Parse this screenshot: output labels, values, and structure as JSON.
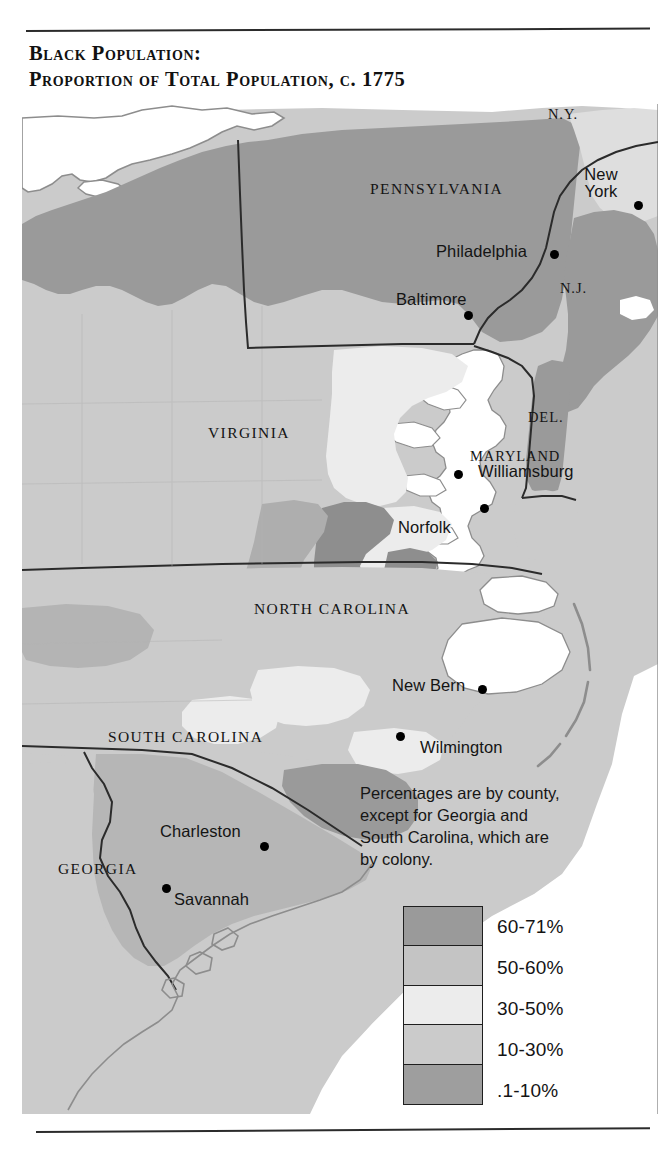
{
  "title": {
    "line1": "Black Population:",
    "line2": "Proportion of Total Population, c. 1775"
  },
  "map": {
    "note_lines": [
      "Percentages are by county,",
      "except for Georgia and",
      "South Carolina, which are",
      "by colony."
    ],
    "states": [
      {
        "name": "pennsylvania",
        "label": "PENNSYLVANIA"
      },
      {
        "name": "new-york",
        "label": "N.Y."
      },
      {
        "name": "new-jersey",
        "label": "N.J."
      },
      {
        "name": "delaware",
        "label": "DEL."
      },
      {
        "name": "maryland",
        "label": "MARYLAND"
      },
      {
        "name": "virginia",
        "label": "VIRGINIA"
      },
      {
        "name": "north-carolina",
        "label": "NORTH CAROLINA"
      },
      {
        "name": "south-carolina",
        "label": "SOUTH CAROLINA"
      },
      {
        "name": "georgia",
        "label": "GEORGIA"
      }
    ],
    "cities": [
      {
        "name": "new-york-city",
        "label_line1": "New",
        "label_line2": "York"
      },
      {
        "name": "philadelphia",
        "label": "Philadelphia"
      },
      {
        "name": "baltimore",
        "label": "Baltimore"
      },
      {
        "name": "williamsburg",
        "label": "Williamsburg"
      },
      {
        "name": "norfolk",
        "label": "Norfolk"
      },
      {
        "name": "new-bern",
        "label": "New Bern"
      },
      {
        "name": "wilmington",
        "label": "Wilmington"
      },
      {
        "name": "charleston",
        "label": "Charleston"
      },
      {
        "name": "savannah",
        "label": "Savannah"
      }
    ]
  },
  "legend": {
    "items": [
      {
        "label": "60-71%",
        "color": "#9a9a9a"
      },
      {
        "label": "50-60%",
        "color": "#c4c4c4"
      },
      {
        "label": "30-50%",
        "color": "#ececec"
      },
      {
        "label": "10-30%",
        "color": "#cbcbcb"
      },
      {
        "label": ".1-10%",
        "color": "#9e9e9e"
      }
    ]
  },
  "colors": {
    "shade_60_71": "#9a9a9a",
    "shade_50_60": "#c4c4c4",
    "shade_30_50": "#ececec",
    "shade_10_30": "#cbcbcb",
    "shade_01_10": "#9e9e9e",
    "water": "#ffffff",
    "border": "#2b2b2b",
    "coastline": "#8d8d8d"
  }
}
